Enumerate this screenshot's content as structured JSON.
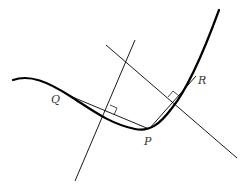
{
  "diagram": {
    "type": "geometry",
    "colors": {
      "stroke": "#000000",
      "label": "#333333",
      "background": "#ffffff"
    },
    "points": {
      "P": {
        "label": "P",
        "x": 149,
        "y": 129
      },
      "Q": {
        "label": "Q",
        "x": 70,
        "y": 96
      },
      "R": {
        "label": "R",
        "x": 196,
        "y": 76
      }
    },
    "labels": {
      "P": "P",
      "Q": "Q",
      "R": "R"
    },
    "chords": [
      {
        "name": "chord-QP",
        "from": "Q",
        "to": "P"
      },
      {
        "name": "chord-PR",
        "from": "P",
        "to": "R"
      }
    ],
    "perpendicular_bisectors": [
      {
        "name": "bisector-QP",
        "x1": 135,
        "y1": 40,
        "x2": 75,
        "y2": 181
      },
      {
        "name": "bisector-PR",
        "x1": 106,
        "y1": 45,
        "x2": 237,
        "y2": 158
      }
    ]
  }
}
